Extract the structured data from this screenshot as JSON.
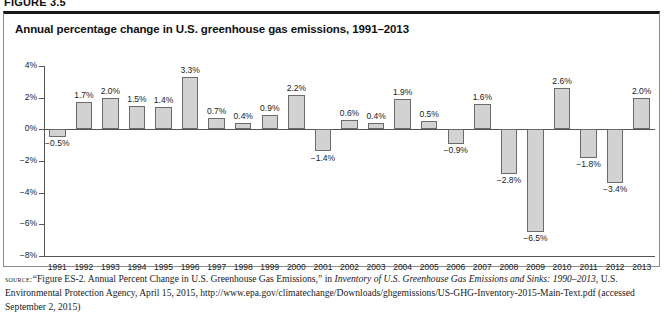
{
  "figure_label": "FIGURE 3.5",
  "chart_title": "Annual percentage change in U.S. greenhouse gas emissions, 1991–2013",
  "source": {
    "label": "source:",
    "part1": "“Figure ES-2. Annual Percent Change in U.S. Greenhouse Gas Emissions,” in ",
    "italic1": "Inventory of U.S. Greenhouse Gas Emissions and Sinks: 1990–2013",
    "part2": ", U.S. Environmental Protection Agency, April 15, 2015, http://www.epa.gov/climatechange/Downloads/ghgemissions/US-GHG-Inventory-2015-Main-Text.pdf (accessed September 2, 2015)"
  },
  "colors": {
    "bar_fill": "#d2d2d2",
    "bar_stroke": "#6b6b6b",
    "axis": "#555555",
    "box_top_border": "#1a1a1a",
    "box_border": "#8c8c8c",
    "text": "#1a1a1a"
  },
  "chart_data": {
    "type": "bar",
    "title": "Annual percentage change in U.S. greenhouse gas emissions, 1991–2013",
    "xlabel": "",
    "ylabel": "",
    "ylim": [
      -8,
      4
    ],
    "grid": false,
    "legend": "none",
    "ytick_labels": [
      "4%",
      "2%",
      "0%",
      "−2%",
      "−4%",
      "−6%",
      "−8%"
    ],
    "ytick_values": [
      4,
      2,
      0,
      -2,
      -4,
      -6,
      -8
    ],
    "categories": [
      "1991",
      "1992",
      "1993",
      "1994",
      "1995",
      "1996",
      "1997",
      "1998",
      "1999",
      "2000",
      "2001",
      "2002",
      "2003",
      "2004",
      "2005",
      "2006",
      "2007",
      "2008",
      "2009",
      "2010",
      "2011",
      "2012",
      "2013"
    ],
    "values": [
      -0.5,
      1.7,
      2.0,
      1.5,
      1.4,
      3.3,
      0.7,
      0.4,
      0.9,
      2.2,
      -1.4,
      0.6,
      0.4,
      1.9,
      0.5,
      -0.9,
      1.6,
      -2.8,
      -6.5,
      2.6,
      -1.8,
      -3.4,
      2.0
    ],
    "data_labels": [
      "−0.5%",
      "1.7%",
      "2.0%",
      "1.5%",
      "1.4%",
      "3.3%",
      "0.7%",
      "0.4%",
      "0.9%",
      "2.2%",
      "−1.4%",
      "0.6%",
      "0.4%",
      "1.9%",
      "0.5%",
      "−0.9%",
      "1.6%",
      "−2.8%",
      "−6.5%",
      "2.6%",
      "−1.8%",
      "−3.4%",
      "2.0%"
    ]
  }
}
